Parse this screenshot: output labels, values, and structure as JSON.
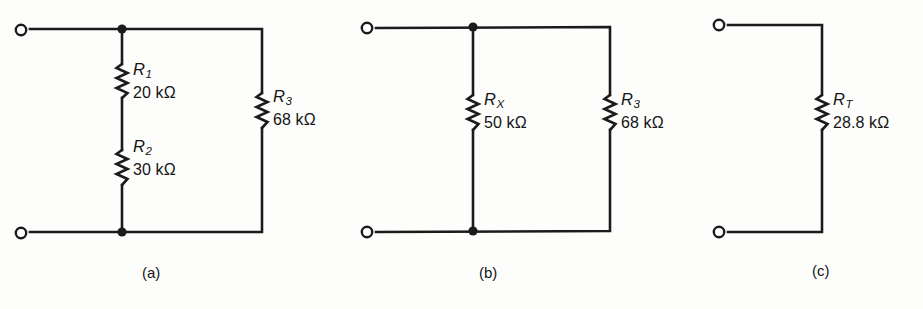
{
  "figure": {
    "background_color": "#fdfdfc",
    "ink_color": "#1b1b1b",
    "circuits": [
      {
        "id": "circuit-a",
        "caption": "(a)",
        "caption_x": 142,
        "caption_y": 264,
        "terminals": [
          {
            "name": "top-left-terminal",
            "cx": 21,
            "cy": 30
          },
          {
            "name": "bottom-left-terminal",
            "cx": 21,
            "cy": 233
          }
        ],
        "nodes": [
          {
            "name": "top-junction",
            "cx": 122,
            "cy": 29
          },
          {
            "name": "bottom-junction",
            "cx": 122,
            "cy": 232
          }
        ],
        "components": [
          {
            "ref": "R1",
            "symbol": "R",
            "subscript": "1",
            "value": "20 kΩ",
            "branch": "middle",
            "x": 122,
            "y_top": 64,
            "y_bottom": 98,
            "label_x": 133,
            "label_y": 60
          },
          {
            "ref": "R2",
            "symbol": "R",
            "subscript": "2",
            "value": "30 kΩ",
            "branch": "middle",
            "x": 122,
            "y_top": 150,
            "y_bottom": 185,
            "label_x": 133,
            "label_y": 137
          },
          {
            "ref": "R3",
            "symbol": "R",
            "subscript": "3",
            "value": "68 kΩ",
            "branch": "right",
            "x": 262,
            "y_top": 93,
            "y_bottom": 128,
            "label_x": 273,
            "label_y": 87
          }
        ]
      },
      {
        "id": "circuit-b",
        "caption": "(b)",
        "caption_x": 479,
        "caption_y": 264,
        "terminals": [
          {
            "name": "top-left-terminal",
            "cx": 367,
            "cy": 28
          },
          {
            "name": "bottom-left-terminal",
            "cx": 367,
            "cy": 232
          }
        ],
        "nodes": [
          {
            "name": "top-junction",
            "cx": 473,
            "cy": 27
          },
          {
            "name": "bottom-junction",
            "cx": 473,
            "cy": 231
          }
        ],
        "components": [
          {
            "ref": "RX",
            "symbol": "R",
            "subscript": "X",
            "value": "50 kΩ",
            "branch": "middle",
            "x": 473,
            "y_top": 95,
            "y_bottom": 130,
            "label_x": 484,
            "label_y": 90
          },
          {
            "ref": "R3",
            "symbol": "R",
            "subscript": "3",
            "value": "68 kΩ",
            "branch": "right",
            "x": 610,
            "y_top": 95,
            "y_bottom": 130,
            "label_x": 621,
            "label_y": 90
          }
        ]
      },
      {
        "id": "circuit-c",
        "caption": "(c)",
        "caption_x": 812,
        "caption_y": 262,
        "terminals": [
          {
            "name": "top-left-terminal",
            "cx": 719,
            "cy": 25
          },
          {
            "name": "bottom-left-terminal",
            "cx": 719,
            "cy": 232
          }
        ],
        "nodes": [],
        "components": [
          {
            "ref": "RT",
            "symbol": "R",
            "subscript": "T",
            "value": "28.8 kΩ",
            "branch": "right",
            "x": 822,
            "y_top": 95,
            "y_bottom": 130,
            "label_x": 833,
            "label_y": 90
          }
        ]
      }
    ]
  },
  "paths": {
    "circuit_a_outline": "M 30 29 L 262 29 L 262 93 M 262 128 L 262 232 L 30 232",
    "circuit_a_middle": "M 122 29 L 122 64 M 122 98 L 122 150 M 122 185 L 122 232",
    "circuit_b_outline": "M 376 28 L 610 27 L 610 95 M 610 130 L 610 231 L 376 232",
    "circuit_b_middle": "M 473 27 L 473 95 M 473 130 L 473 231",
    "circuit_c_outline": "M 728 25 L 822 25 L 822 95 M 822 130 L 822 232 L 728 232"
  }
}
